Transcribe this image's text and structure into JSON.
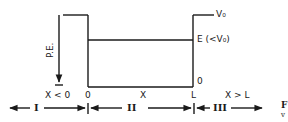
{
  "diagram": {
    "type": "finite potential well energy diagram",
    "colors": {
      "ink": "#1a1a1a",
      "background": "#ffffff"
    },
    "axis": {
      "label": "P.E."
    },
    "levels": {
      "barrier": "V₀",
      "energy": "E (<V₀)",
      "bottom_left": "0",
      "bottom_right": "0"
    },
    "x_labels": {
      "left_region": "X < 0",
      "origin": "0",
      "middle": "X",
      "right_edge": "L",
      "right_region": "X > L"
    },
    "regions": [
      {
        "numeral": "I"
      },
      {
        "numeral": "II"
      },
      {
        "numeral": "III"
      }
    ],
    "cropped_edge_text": {
      "line1": "F",
      "line2": "v"
    }
  }
}
